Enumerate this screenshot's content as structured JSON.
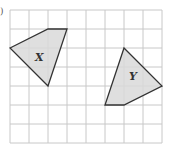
{
  "figure": {
    "part_label": ")",
    "grid": {
      "columns": 8,
      "rows": 7,
      "cell_size": 19,
      "origin": [
        10,
        10
      ],
      "line_color": "#c8c8c8"
    },
    "shapes": [
      {
        "name": "X",
        "label": "X",
        "vertices": [
          [
            0,
            2
          ],
          [
            2,
            1
          ],
          [
            3,
            1
          ],
          [
            2,
            4
          ]
        ],
        "fill": "#d9d9d9",
        "stroke": "#333333"
      },
      {
        "name": "Y",
        "label": "Y",
        "vertices": [
          [
            6,
            2
          ],
          [
            8,
            4
          ],
          [
            6,
            5
          ],
          [
            5,
            5
          ]
        ],
        "fill": "#d9d9d9",
        "stroke": "#333333"
      }
    ]
  }
}
